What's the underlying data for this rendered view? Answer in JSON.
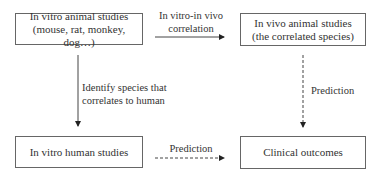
{
  "nodes": {
    "in_vitro_animal": {
      "line1": "In vitro animal studies",
      "line2": "(mouse, rat, monkey, dog…)"
    },
    "in_vivo_animal": {
      "line1": "In vivo animal studies",
      "line2": "(the correlated species)"
    },
    "in_vitro_human": {
      "line1": "In vitro human studies"
    },
    "clinical_outcomes": {
      "line1": "Clinical outcomes"
    }
  },
  "edges": {
    "ivivc": {
      "line1": "In vitro-in vivo",
      "line2": "correlation",
      "style": "solid"
    },
    "identify": {
      "line1": "Identify species that",
      "line2": "correlates to human",
      "style": "solid"
    },
    "prediction_right": {
      "label": "Prediction",
      "style": "dashed"
    },
    "prediction_bottom": {
      "label": "Prediction",
      "style": "dashed"
    }
  }
}
